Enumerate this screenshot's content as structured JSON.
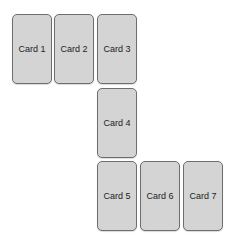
{
  "cards": [
    {
      "label": "Card 1"
    },
    {
      "label": "Card 2"
    },
    {
      "label": "Card 3"
    },
    {
      "label": "Card 4"
    },
    {
      "label": "Card 5"
    },
    {
      "label": "Card 6"
    },
    {
      "label": "Card 7"
    }
  ],
  "colors": {
    "card_fill": "#d4d4d4",
    "card_border": "#6e6e6e",
    "background": "#ffffff"
  }
}
